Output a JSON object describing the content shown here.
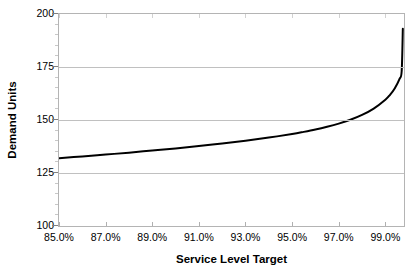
{
  "chart_data": {
    "type": "line",
    "title": "",
    "xlabel": "Service Level Target",
    "ylabel": "Demand Units",
    "xlim": [
      85.0,
      99.8
    ],
    "ylim": [
      100,
      200
    ],
    "grid": true,
    "legend": "none",
    "line_color": "#000000",
    "line_width": 2,
    "axis_color": "#b4b4b4",
    "gridline_color": "#c0c0c0",
    "x_tick_labels": [
      "85.0%",
      "87.0%",
      "89.0%",
      "91.0%",
      "93.0%",
      "95.0%",
      "97.0%",
      "99.0%"
    ],
    "x_tick_values": [
      85.0,
      87.0,
      89.0,
      91.0,
      93.0,
      95.0,
      97.0,
      99.0
    ],
    "y_tick_labels": [
      "200",
      "175",
      "150",
      "125",
      "100"
    ],
    "y_tick_values": [
      200,
      175,
      150,
      125,
      100
    ],
    "x": [
      85.0,
      86.0,
      87.0,
      88.0,
      89.0,
      90.0,
      91.0,
      92.0,
      93.0,
      94.0,
      95.0,
      95.5,
      96.0,
      96.5,
      97.0,
      97.5,
      98.0,
      98.5,
      99.0,
      99.2,
      99.4,
      99.6,
      99.7,
      99.75
    ],
    "values": [
      132.0,
      132.8,
      133.7,
      134.6,
      135.6,
      136.6,
      137.7,
      138.9,
      140.2,
      141.7,
      143.4,
      144.4,
      145.5,
      146.8,
      148.3,
      150.1,
      152.4,
      155.4,
      159.6,
      161.9,
      164.9,
      169.2,
      173.0,
      193.0
    ],
    "series": [
      {
        "name": "Demand Units",
        "values": [
          132.0,
          132.8,
          133.7,
          134.6,
          135.6,
          136.6,
          137.7,
          138.9,
          140.2,
          141.7,
          143.4,
          144.4,
          145.5,
          146.8,
          148.3,
          150.1,
          152.4,
          155.4,
          159.6,
          161.9,
          164.9,
          169.2,
          173.0,
          193.0
        ]
      }
    ]
  }
}
